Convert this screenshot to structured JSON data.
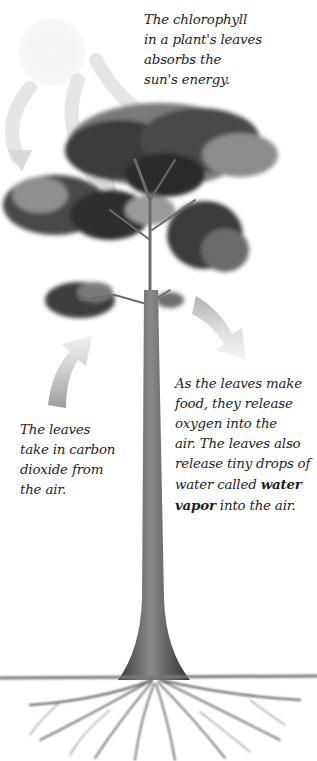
{
  "figure": {
    "colors": {
      "background": "#ffffff",
      "text": "#1e1e1e",
      "foliage_dark": "#2e2e2e",
      "foliage_mid": "#6a6a6a",
      "foliage_light": "#a8a8a8",
      "trunk": "#5a5a5a",
      "arrow": "#c8c8c8",
      "sun": "#f1f1f1"
    }
  },
  "captions": {
    "sun": {
      "lines": [
        "The chlorophyll",
        "in a plant's leaves",
        "absorbs the",
        "sun's energy."
      ]
    },
    "co2": {
      "lines": [
        "The leaves",
        "take in carbon",
        "dioxide from",
        "the air."
      ]
    },
    "o2": {
      "lines": [
        "As the leaves make",
        "food, they release",
        "oxygen into the",
        "air. The leaves also",
        "release tiny drops of",
        "water called "
      ],
      "bold_term_1": "water",
      "bold_term_2": "vapor",
      "after_bold": " into the air."
    }
  },
  "icons": {
    "sun": "sun-icon",
    "sun_arrows": "curved-arrow-icon",
    "co2_arrow": "up-arrow-icon",
    "o2_arrow": "down-arrow-icon"
  }
}
